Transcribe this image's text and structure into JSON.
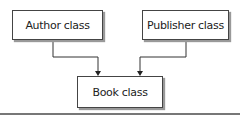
{
  "diagram": {
    "nodes": [
      {
        "id": "author",
        "label": "Author class"
      },
      {
        "id": "publisher",
        "label": "Publisher class"
      },
      {
        "id": "book",
        "label": "Book class"
      }
    ],
    "edges": [
      {
        "from": "author",
        "to": "book"
      },
      {
        "from": "publisher",
        "to": "book"
      }
    ]
  }
}
